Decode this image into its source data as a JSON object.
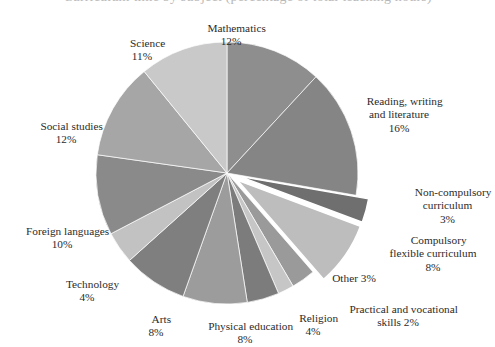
{
  "title": {
    "text": "Curriculum time by subject (percentage of total teaching hours)",
    "clipped": true
  },
  "chart_data": {
    "type": "pie",
    "title": "Curriculum time by subject (percentage of total teaching hours)",
    "xlabel": "",
    "ylabel": "",
    "units": "percent",
    "start_angle_deg": 0,
    "direction": "clockwise",
    "total": 101,
    "legend": "none-labels-outside",
    "grid": false,
    "categories": [
      "Mathematics",
      "Reading, writing and literature",
      "Non-compulsory curriculum",
      "Compulsory flexible curriculum",
      "Other",
      "Practical and vocational skills",
      "Religion",
      "Physical education",
      "Arts",
      "Technology",
      "Foreign languages",
      "Social studies",
      "Science"
    ],
    "values": [
      12,
      16,
      3,
      8,
      3,
      2,
      4,
      8,
      8,
      4,
      10,
      12,
      11
    ],
    "labels": [
      "12%",
      "16%",
      "3%",
      "8%",
      "3%",
      "2%",
      "4%",
      "8%",
      "8%",
      "4%",
      "10%",
      "12%",
      "11%"
    ],
    "exploded": [
      "Non-compulsory curriculum",
      "Compulsory flexible curriculum"
    ],
    "colors": [
      "#8e8e8e",
      "#858585",
      "#6f6f6f",
      "#bdbdbd",
      "#9a9a9a",
      "#c6c6c6",
      "#7c7c7c",
      "#9c9c9c",
      "#7f7f7f",
      "#c2c2c2",
      "#8a8a8a",
      "#a6a6a6",
      "#c9c9c9"
    ],
    "slices": [
      {
        "name": "Mathematics",
        "value": 12,
        "label": "Mathematics",
        "pct": "12%",
        "color": "#8e8e8e",
        "exploded": false
      },
      {
        "name": "Reading, writing and literature",
        "value": 16,
        "label": "Reading, writing\nand literature",
        "pct": "16%",
        "color": "#858585",
        "exploded": false
      },
      {
        "name": "Non-compulsory curriculum",
        "value": 3,
        "label": "Non-compulsory\ncurriculum",
        "pct": "3%",
        "color": "#6f6f6f",
        "exploded": true
      },
      {
        "name": "Compulsory flexible curriculum",
        "value": 8,
        "label": "Compulsory\nflexible curriculum",
        "pct": "8%",
        "color": "#bdbdbd",
        "exploded": true
      },
      {
        "name": "Other",
        "value": 3,
        "label": "Other",
        "pct": "3%",
        "color": "#9a9a9a",
        "exploded": false
      },
      {
        "name": "Practical and vocational skills",
        "value": 2,
        "label": "Practical and vocational\nskills",
        "pct": "2%",
        "color": "#c6c6c6",
        "exploded": false
      },
      {
        "name": "Religion",
        "value": 4,
        "label": "Religion",
        "pct": "4%",
        "color": "#7c7c7c",
        "exploded": false
      },
      {
        "name": "Physical education",
        "value": 8,
        "label": "Physical education",
        "pct": "8%",
        "color": "#9c9c9c",
        "exploded": false
      },
      {
        "name": "Arts",
        "value": 8,
        "label": "Arts",
        "pct": "8%",
        "color": "#7f7f7f",
        "exploded": false
      },
      {
        "name": "Technology",
        "value": 4,
        "label": "Technology",
        "pct": "4%",
        "color": "#c2c2c2",
        "exploded": false
      },
      {
        "name": "Foreign languages",
        "value": 10,
        "label": "Foreign languages",
        "pct": "10%",
        "color": "#8a8a8a",
        "exploded": false
      },
      {
        "name": "Social studies",
        "value": 12,
        "label": "Social studies",
        "pct": "12%",
        "color": "#a6a6a6",
        "exploded": false
      },
      {
        "name": "Science",
        "value": 11,
        "label": "Science",
        "pct": "11%",
        "color": "#c9c9c9",
        "exploded": false
      }
    ]
  },
  "labels": {
    "mathematics": {
      "name": "Mathematics",
      "pct": "12%"
    },
    "reading": {
      "l1": "Reading, writing",
      "l2": "and literature",
      "pct": "16%"
    },
    "non_compulsory": {
      "l1": "Non-compulsory",
      "l2": "curriculum",
      "pct": "3%"
    },
    "compulsory_flex": {
      "l1": "Compulsory",
      "l2": "flexible curriculum",
      "pct": "8%"
    },
    "other": {
      "name": "Other 3%"
    },
    "practical": {
      "l1": "Practical and vocational",
      "l2": "skills 2%"
    },
    "religion": {
      "name": "Religion",
      "pct": "4%"
    },
    "physical_education": {
      "name": "Physical education",
      "pct": "8%"
    },
    "arts": {
      "name": "Arts",
      "pct": "8%"
    },
    "technology": {
      "name": "Technology",
      "pct": "4%"
    },
    "foreign_languages": {
      "name": "Foreign languages",
      "pct": "10%"
    },
    "social_studies": {
      "name": "Social studies",
      "pct": "12%"
    },
    "science": {
      "name": "Science",
      "pct": "11%"
    }
  }
}
